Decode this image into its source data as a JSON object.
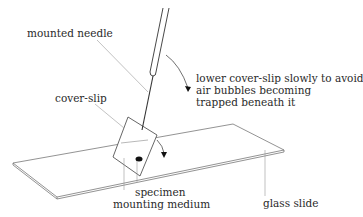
{
  "diagram": {
    "type": "labelled illustration",
    "labels": {
      "mounted_needle": "mounted needle",
      "cover_slip": "cover-slip",
      "instruction": "lower cover-slip slowly to avoid\nair bubbles becoming\ntrapped beneath it",
      "specimen": "specimen",
      "mounting_medium": "mounting medium",
      "glass_slide": "glass slide"
    },
    "colors": {
      "line": "#333333",
      "leader": "#888888",
      "text": "#2a2a2a",
      "background": "#ffffff"
    }
  }
}
